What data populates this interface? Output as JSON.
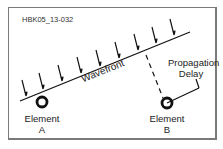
{
  "figure_id": "HBK05_13-032",
  "labels": {
    "wavefront": "Wavefront",
    "propagation_delay_line1": "Propagation",
    "propagation_delay_line2": "Delay",
    "element_a_line1": "Element",
    "element_a_line2": "A",
    "element_b_line1": "Element",
    "element_b_line2": "B"
  },
  "colors": {
    "stroke": "#111111",
    "frame": "#7a7a7a",
    "text": "#222222"
  },
  "arrows_count": 9
}
